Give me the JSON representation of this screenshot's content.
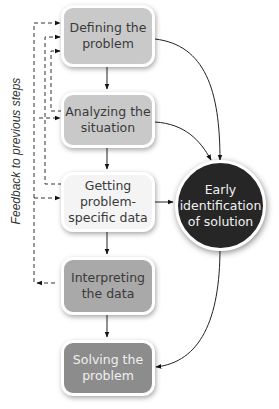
{
  "diagram": {
    "side_label": "Feedback to previous steps",
    "steps": [
      {
        "id": "defining",
        "label": "Defining the\nproblem",
        "fill": "#c9c9c9",
        "text_color": "#3a3a3a"
      },
      {
        "id": "analyzing",
        "label": "Analyzing the\nsituation",
        "fill": "#c9c9c9",
        "text_color": "#3a3a3a"
      },
      {
        "id": "getting",
        "label": "Getting\nproblem-\nspecific data",
        "fill": "#f4f4f4",
        "text_color": "#3a3a3a"
      },
      {
        "id": "interpreting",
        "label": "Interpreting\nthe data",
        "fill": "#a9a9a9",
        "text_color": "#3a3a3a"
      },
      {
        "id": "solving",
        "label": "Solving the\nproblem",
        "fill": "#8c8c8c",
        "text_color": "#f0f0f0"
      }
    ],
    "hub": {
      "label": "Early\nidentification\nof solution",
      "fill": "#262626",
      "text_color": "#f2f2f2"
    },
    "edges": [
      {
        "from": "defining",
        "to": "analyzing",
        "style": "solid"
      },
      {
        "from": "analyzing",
        "to": "getting",
        "style": "solid"
      },
      {
        "from": "getting",
        "to": "interpreting",
        "style": "solid"
      },
      {
        "from": "interpreting",
        "to": "solving",
        "style": "solid"
      },
      {
        "from": "defining",
        "to": "hub",
        "style": "solid"
      },
      {
        "from": "analyzing",
        "to": "hub",
        "style": "solid"
      },
      {
        "from": "getting",
        "to": "hub",
        "style": "solid"
      },
      {
        "from": "hub",
        "to": "solving",
        "style": "solid"
      },
      {
        "from": "analyzing",
        "to": "defining",
        "style": "dashed"
      },
      {
        "from": "getting",
        "to": "defining",
        "style": "dashed"
      },
      {
        "from": "interpreting",
        "to": "defining",
        "style": "dashed"
      },
      {
        "from": "interpreting",
        "to": "analyzing",
        "style": "dashed"
      },
      {
        "from": "interpreting",
        "to": "getting",
        "style": "dashed"
      }
    ]
  }
}
